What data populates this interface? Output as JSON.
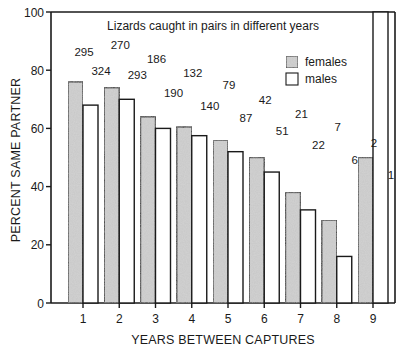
{
  "chart_data": {
    "type": "bar",
    "title": "Lizards caught in pairs in different years",
    "xlabel": "YEARS BETWEEN CAPTURES",
    "ylabel": "PERCENT SAME PARTNER",
    "categories": [
      "1",
      "2",
      "3",
      "4",
      "5",
      "6",
      "7",
      "8",
      "9"
    ],
    "ylim": [
      0,
      100
    ],
    "yticks": [
      0,
      20,
      40,
      60,
      80,
      100
    ],
    "grid": false,
    "legend": {
      "position": "top-right",
      "entries": [
        "females",
        "males"
      ]
    },
    "series": [
      {
        "name": "females",
        "color": "#c8c8c8",
        "values": [
          76,
          74,
          64,
          60.5,
          56,
          50,
          38,
          28.5,
          50
        ],
        "counts": [
          "295",
          "270",
          "186",
          "132",
          "79",
          "42",
          "21",
          "7",
          "2"
        ]
      },
      {
        "name": "males",
        "color": "#ffffff",
        "values": [
          68,
          70,
          60,
          57.5,
          52,
          45,
          32,
          16,
          100
        ],
        "counts": [
          "324",
          "293",
          "190",
          "140",
          "87",
          "51",
          "22",
          "6",
          "1"
        ]
      }
    ]
  }
}
